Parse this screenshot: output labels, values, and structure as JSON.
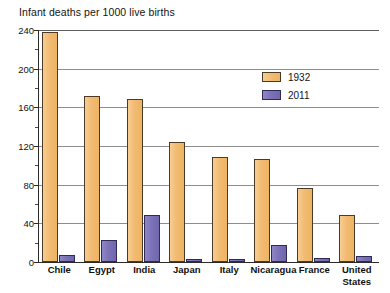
{
  "chart_data": {
    "type": "bar",
    "title": "Infant deaths per 1000 live births",
    "xlabel": "",
    "ylabel": "",
    "ylim": [
      0,
      240
    ],
    "yticks": [
      0,
      40,
      80,
      120,
      160,
      200,
      240
    ],
    "ytick_labels": [
      "0",
      "40",
      "80",
      "120",
      "160",
      "200",
      "240"
    ],
    "grid": true,
    "legend_position": "upper right",
    "categories": [
      "Chile",
      "Egypt",
      "India",
      "Japan",
      "Italy",
      "Nicaragua",
      "France",
      "United States"
    ],
    "category_lines": [
      [
        "Chile"
      ],
      [
        "Egypt"
      ],
      [
        "India"
      ],
      [
        "Japan"
      ],
      [
        "Italy"
      ],
      [
        "Nicaragua"
      ],
      [
        "France"
      ],
      [
        "United",
        "States"
      ]
    ],
    "series": [
      {
        "name": "1932",
        "color": "#F2BB72",
        "values": [
          238,
          172,
          169,
          124,
          109,
          107,
          77,
          49
        ]
      },
      {
        "name": "2011",
        "color": "#7A71B6",
        "values": [
          7,
          23,
          49,
          3,
          3,
          18,
          4,
          6
        ]
      }
    ]
  },
  "legend": {
    "entries": [
      {
        "label": "1932"
      },
      {
        "label": "2011"
      }
    ]
  }
}
